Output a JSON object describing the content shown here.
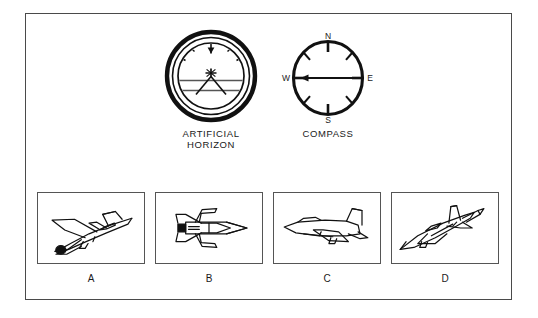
{
  "figure": {
    "type": "aircraft-attitude-question-figure",
    "instruments": [
      {
        "id": "artificial-horizon",
        "label": "ARTIFICIAL\nHORIZON",
        "icon": "artificial-horizon-icon",
        "reading": "wings level, nose slightly above horizon, pointer at top center"
      },
      {
        "id": "compass",
        "label": "COMPASS",
        "icon": "compass-icon",
        "heading_indicated": "W",
        "cardinals": [
          "N",
          "E",
          "S",
          "W"
        ],
        "needle_direction": "west"
      }
    ],
    "compass_marks": {
      "north": "N",
      "east": "E",
      "south": "S",
      "west": "W"
    },
    "photos": [
      {
        "label": "A",
        "icon": "aircraft-banked-descending-icon",
        "description": "jet rolled and descending toward lower left"
      },
      {
        "label": "B",
        "icon": "aircraft-plan-view-icon",
        "description": "jet seen from above, nose pointing right, wings level"
      },
      {
        "label": "C",
        "icon": "aircraft-side-view-left-icon",
        "description": "jet in level flight pointing left"
      },
      {
        "label": "D",
        "icon": "aircraft-climbing-left-icon",
        "description": "jet climbing toward upper right with tail fin prominent"
      }
    ],
    "colors": {
      "ink": "#1a1a1a",
      "frame": "#4a4a4a",
      "box_border": "#555555",
      "background": "#ffffff"
    }
  }
}
